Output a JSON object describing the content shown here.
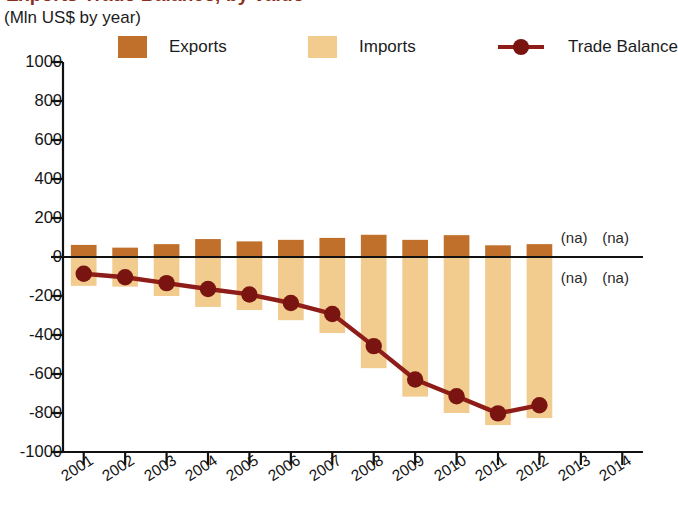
{
  "header": {
    "title": "Exports Trade Balance, by value",
    "subtitle": "(Mln US$ by year)"
  },
  "legend": {
    "position": "top",
    "items": [
      {
        "label": "Exports",
        "icon": "square-swatch",
        "color": "#c0702a"
      },
      {
        "label": "Imports",
        "icon": "square-swatch",
        "color": "#f2cc8f"
      },
      {
        "label": "Trade Balance",
        "icon": "line-marker",
        "color": "#8e1c18"
      }
    ]
  },
  "annotations": {
    "na_text": "(na)",
    "na_cells": [
      {
        "year": "2013",
        "where": "above-axis"
      },
      {
        "year": "2014",
        "where": "above-axis"
      },
      {
        "year": "2013",
        "where": "below-axis"
      },
      {
        "year": "2014",
        "where": "below-axis"
      }
    ]
  },
  "chart_data": {
    "type": "bar",
    "title": "Exports Trade Balance, by value",
    "subtitle": "(Mln US$ by year)",
    "xlabel": "",
    "ylabel": "Mln US$",
    "ylim": [
      -1000,
      1000
    ],
    "yticks": [
      1000,
      800,
      600,
      400,
      200,
      0,
      -200,
      -400,
      -600,
      -800,
      -1000
    ],
    "ytick_labels": [
      "1000",
      "800",
      "600",
      "400",
      "200",
      "0",
      "-200",
      "-400",
      "-600",
      "-800",
      "-1000"
    ],
    "grid": false,
    "categories": [
      "2001",
      "2002",
      "2003",
      "2004",
      "2005",
      "2006",
      "2007",
      "2008",
      "2009",
      "2010",
      "2011",
      "2012",
      "2013",
      "2014"
    ],
    "series": [
      {
        "name": "Exports",
        "type": "bar",
        "color": "#c0702a",
        "values": [
          62,
          48,
          66,
          92,
          80,
          88,
          98,
          114,
          88,
          112,
          60,
          66,
          null,
          null
        ]
      },
      {
        "name": "Imports",
        "type": "bar",
        "color": "#f2cc8f",
        "values": [
          -148,
          -152,
          -200,
          -256,
          -272,
          -324,
          -390,
          -570,
          -716,
          -800,
          -862,
          -826,
          null,
          null
        ]
      },
      {
        "name": "Trade Balance",
        "type": "line",
        "color": "#8e1c18",
        "marker": "circle",
        "values": [
          -86,
          -104,
          -134,
          -164,
          -192,
          -236,
          -292,
          -457,
          -628,
          -714,
          -802,
          -760,
          null,
          null
        ]
      }
    ]
  }
}
